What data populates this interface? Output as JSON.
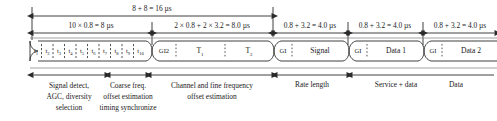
{
  "diagram": {
    "dimension_labels": {
      "total": "8 + 8 = 16 µs",
      "short_training": "10 × 0.8 = 8 µs",
      "long_training": "2 × 0.8 + 2 × 3.2 = 8.0 µs",
      "signal": "0.8 + 3.2 = 4.0 µs",
      "data1": "0.8 + 3.2 = 4.0 µs",
      "data2": "0.8 + 3.2 = 4.0 µs"
    },
    "short_training_symbols": [
      {
        "base": "t",
        "sub": "1"
      },
      {
        "base": "t",
        "sub": "2"
      },
      {
        "base": "t",
        "sub": "3"
      },
      {
        "base": "t",
        "sub": "4"
      },
      {
        "base": "t",
        "sub": "5"
      },
      {
        "base": "t",
        "sub": "6"
      },
      {
        "base": "t",
        "sub": "7"
      },
      {
        "base": "t",
        "sub": "8"
      },
      {
        "base": "t",
        "sub": "9"
      },
      {
        "base": "t",
        "sub": "10"
      }
    ],
    "blocks": {
      "gi2": "GI2",
      "t1_base": "T",
      "t1_sub": "1",
      "t2_base": "T",
      "t2_sub": "2",
      "gi_signal": "GI",
      "signal": "Signal",
      "gi_data1": "GI",
      "data1": "Data 1",
      "gi_data2": "GI",
      "data2": "Data 2"
    },
    "annotations": {
      "signal_detect": "Signal detect,\nAGC, diversity\nselection",
      "signal_detect_line1": "Signal detect,",
      "signal_detect_line2": "AGC, diversity",
      "signal_detect_line3": "selection",
      "coarse_freq_line1": "Coarse freq.",
      "coarse_freq_line2": "offset estimation",
      "coarse_freq_line3": "timing synchronize",
      "channel_est_line1": "Channel and fine frequency",
      "channel_est_line2": "offset estimation",
      "rate_length": "Rate length",
      "service_data": "Service + data",
      "data": "Data"
    },
    "colors": {
      "line": "#2b2b2b",
      "block_fill": "#ffffff",
      "background": "#ffffff"
    }
  }
}
